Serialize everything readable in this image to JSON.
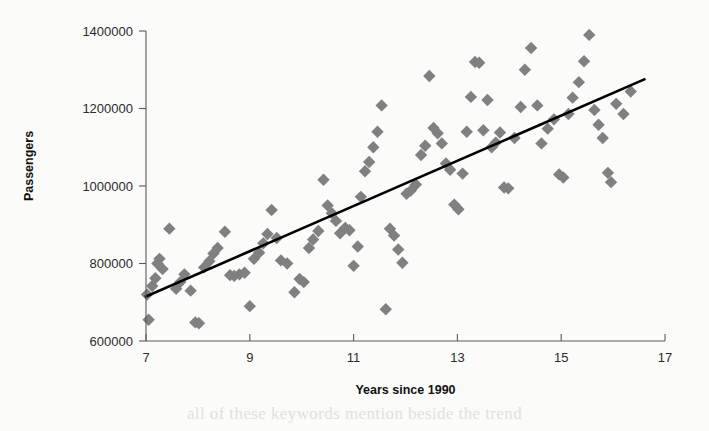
{
  "chart_data": {
    "type": "scatter",
    "title": "",
    "xlabel": "Years since 1990",
    "ylabel": "Passengers",
    "xlim": [
      7,
      17
    ],
    "ylim": [
      600000,
      1400000
    ],
    "grid": false,
    "legend": null,
    "marker_style": "diamond",
    "marker_color": "#808080",
    "xticks": [
      7,
      9,
      11,
      13,
      15,
      17
    ],
    "xtick_labels": [
      "7",
      "9",
      "11",
      "13",
      "15",
      "17"
    ],
    "yticks": [
      600000,
      800000,
      1000000,
      1200000,
      1400000
    ],
    "ytick_labels": [
      "600000",
      "800000",
      "1000000",
      "1200000",
      "1400000"
    ],
    "trend_line": {
      "type": "linear-fit",
      "color": "#000000",
      "x_start": 7.0,
      "y_start": 715000,
      "x_end": 16.6,
      "y_end": 1275000
    },
    "points": [
      [
        7.02,
        720000
      ],
      [
        7.05,
        655000
      ],
      [
        7.12,
        742000
      ],
      [
        7.18,
        762000
      ],
      [
        7.22,
        800000
      ],
      [
        7.26,
        812000
      ],
      [
        7.32,
        786000
      ],
      [
        7.45,
        890000
      ],
      [
        7.58,
        735000
      ],
      [
        7.66,
        752000
      ],
      [
        7.74,
        772000
      ],
      [
        7.86,
        730000
      ],
      [
        7.95,
        648000
      ],
      [
        8.02,
        646000
      ],
      [
        8.12,
        790000
      ],
      [
        8.22,
        806000
      ],
      [
        8.3,
        826000
      ],
      [
        8.38,
        840000
      ],
      [
        8.52,
        882000
      ],
      [
        8.62,
        770000
      ],
      [
        8.7,
        768000
      ],
      [
        8.8,
        772000
      ],
      [
        8.9,
        776000
      ],
      [
        9.0,
        690000
      ],
      [
        9.08,
        812000
      ],
      [
        9.18,
        828000
      ],
      [
        9.26,
        852000
      ],
      [
        9.34,
        876000
      ],
      [
        9.42,
        938000
      ],
      [
        9.52,
        866000
      ],
      [
        9.6,
        808000
      ],
      [
        9.72,
        800000
      ],
      [
        9.86,
        726000
      ],
      [
        9.96,
        760000
      ],
      [
        10.04,
        752000
      ],
      [
        10.14,
        840000
      ],
      [
        10.22,
        862000
      ],
      [
        10.32,
        884000
      ],
      [
        10.42,
        1016000
      ],
      [
        10.5,
        950000
      ],
      [
        10.58,
        930000
      ],
      [
        10.66,
        910000
      ],
      [
        10.74,
        878000
      ],
      [
        10.84,
        892000
      ],
      [
        10.92,
        886000
      ],
      [
        11.0,
        794000
      ],
      [
        11.08,
        844000
      ],
      [
        11.14,
        972000
      ],
      [
        11.22,
        1038000
      ],
      [
        11.3,
        1062000
      ],
      [
        11.38,
        1100000
      ],
      [
        11.46,
        1140000
      ],
      [
        11.54,
        1208000
      ],
      [
        11.62,
        682000
      ],
      [
        11.7,
        890000
      ],
      [
        11.78,
        872000
      ],
      [
        11.86,
        836000
      ],
      [
        11.94,
        802000
      ],
      [
        12.02,
        980000
      ],
      [
        12.1,
        988000
      ],
      [
        12.2,
        1004000
      ],
      [
        12.3,
        1080000
      ],
      [
        12.38,
        1104000
      ],
      [
        12.46,
        1284000
      ],
      [
        12.54,
        1150000
      ],
      [
        12.62,
        1136000
      ],
      [
        12.7,
        1110000
      ],
      [
        12.78,
        1058000
      ],
      [
        12.86,
        1042000
      ],
      [
        12.94,
        952000
      ],
      [
        13.02,
        940000
      ],
      [
        13.1,
        1032000
      ],
      [
        13.18,
        1140000
      ],
      [
        13.26,
        1230000
      ],
      [
        13.34,
        1320000
      ],
      [
        13.42,
        1318000
      ],
      [
        13.5,
        1144000
      ],
      [
        13.58,
        1222000
      ],
      [
        13.66,
        1100000
      ],
      [
        13.74,
        1112000
      ],
      [
        13.82,
        1138000
      ],
      [
        13.9,
        996000
      ],
      [
        13.98,
        994000
      ],
      [
        14.1,
        1124000
      ],
      [
        14.22,
        1204000
      ],
      [
        14.3,
        1300000
      ],
      [
        14.42,
        1356000
      ],
      [
        14.54,
        1208000
      ],
      [
        14.62,
        1110000
      ],
      [
        14.74,
        1148000
      ],
      [
        14.86,
        1172000
      ],
      [
        14.96,
        1030000
      ],
      [
        15.04,
        1022000
      ],
      [
        15.14,
        1186000
      ],
      [
        15.22,
        1228000
      ],
      [
        15.34,
        1268000
      ],
      [
        15.44,
        1322000
      ],
      [
        15.54,
        1390000
      ],
      [
        15.64,
        1196000
      ],
      [
        15.72,
        1158000
      ],
      [
        15.8,
        1124000
      ],
      [
        15.9,
        1034000
      ],
      [
        15.96,
        1010000
      ],
      [
        16.06,
        1212000
      ],
      [
        16.2,
        1186000
      ],
      [
        16.34,
        1244000
      ]
    ]
  },
  "background_bleed_text": "all of these keywords mention beside the trend"
}
